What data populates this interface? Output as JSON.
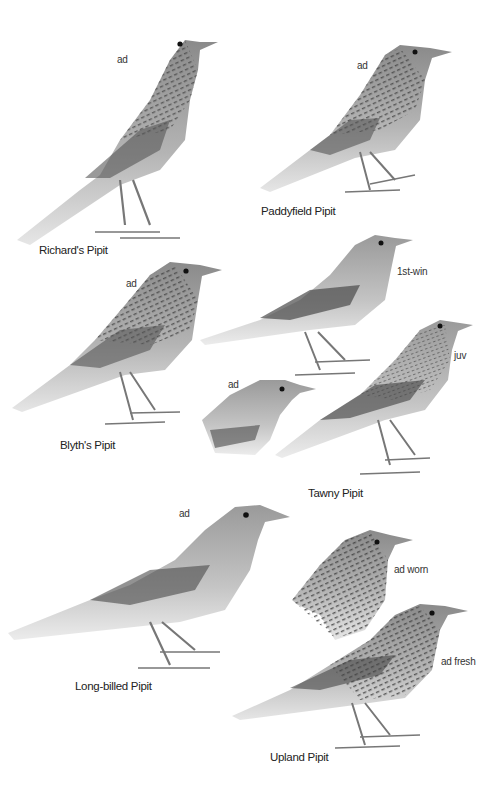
{
  "plate": {
    "background": "#ffffff",
    "species": [
      {
        "name": "Richard's Pipit",
        "figures": [
          {
            "age": "ad"
          }
        ]
      },
      {
        "name": "Paddyfield Pipit",
        "figures": [
          {
            "age": "ad"
          }
        ]
      },
      {
        "name": "Blyth's Pipit",
        "figures": [
          {
            "age": "ad"
          }
        ]
      },
      {
        "name": "Tawny Pipit",
        "figures": [
          {
            "age": "1st-win"
          },
          {
            "age": "juv"
          },
          {
            "age": "ad"
          }
        ]
      },
      {
        "name": "Long-billed Pipit",
        "figures": [
          {
            "age": "ad"
          }
        ]
      },
      {
        "name": "Upland Pipit",
        "figures": [
          {
            "age": "ad worn"
          },
          {
            "age": "ad fresh"
          }
        ]
      }
    ]
  }
}
